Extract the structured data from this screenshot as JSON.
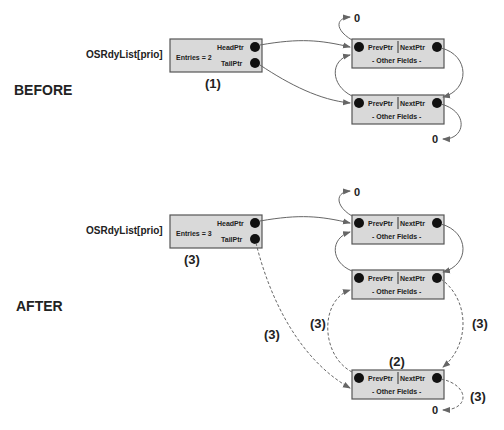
{
  "sections": {
    "before": "BEFORE",
    "after": "AFTER"
  },
  "list_label": "OSRdyList[prio]",
  "before": {
    "header": {
      "entries": "Entries = 2",
      "head": "HeadPtr",
      "tail": "TailPtr",
      "step": "(1)"
    },
    "nodes": [
      {
        "prev": "PrevPtr",
        "next": "NextPtr",
        "other": "- Other Fields -",
        "null_label": "0"
      },
      {
        "prev": "PrevPtr",
        "next": "NextPtr",
        "other": "- Other Fields -",
        "null_label": "0"
      }
    ]
  },
  "after": {
    "header": {
      "entries": "Entries = 3",
      "head": "HeadPtr",
      "tail": "TailPtr",
      "step": "(3)"
    },
    "nodes": [
      {
        "prev": "PrevPtr",
        "next": "NextPtr",
        "other": "- Other Fields -",
        "null_label": "0"
      },
      {
        "prev": "PrevPtr",
        "next": "NextPtr",
        "other": "- Other Fields -"
      },
      {
        "prev": "PrevPtr",
        "next": "NextPtr",
        "other": "- Other Fields -",
        "null_label": "0",
        "step": "(2)"
      }
    ],
    "annotations": {
      "tail_link": "(3)",
      "prev_link": "(3)",
      "next_link": "(3)",
      "null_link": "(3)"
    }
  }
}
